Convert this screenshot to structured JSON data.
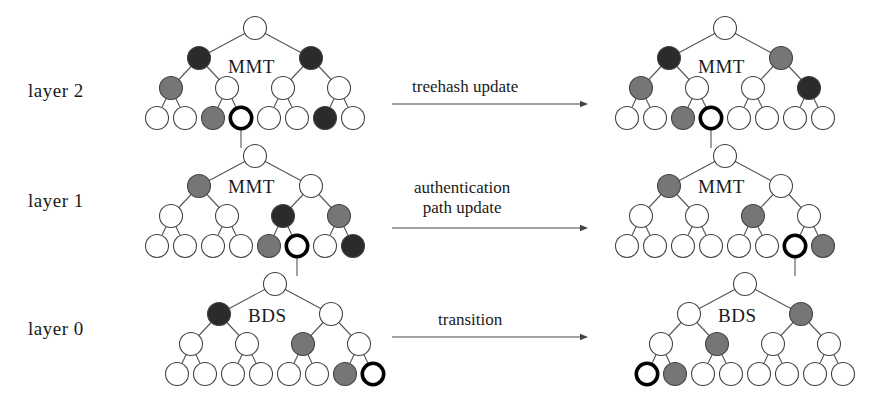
{
  "figure": {
    "background": "#ffffff",
    "width": 895,
    "height": 394
  },
  "colors": {
    "node_white": "#ffffff",
    "node_gray": "#767676",
    "node_dark": "#2b2b2b",
    "node_highlight_stroke": "#000000",
    "edge": "#555555",
    "text": "#1a1a1a"
  },
  "layer_labels": [
    {
      "text": "layer 2",
      "x": 28,
      "y": 80
    },
    {
      "text": "layer 1",
      "x": 28,
      "y": 190
    },
    {
      "text": "layer 0",
      "x": 28,
      "y": 318
    }
  ],
  "tree_names": [
    {
      "text": "MMT",
      "x": 228,
      "y": 56
    },
    {
      "text": "MMT",
      "x": 698,
      "y": 56
    },
    {
      "text": "MMT",
      "x": 228,
      "y": 176
    },
    {
      "text": "MMT",
      "x": 698,
      "y": 176
    },
    {
      "text": "BDS",
      "x": 248,
      "y": 305
    },
    {
      "text": "BDS",
      "x": 718,
      "y": 305
    }
  ],
  "arrows": [
    {
      "name": "treehash-update",
      "lines": [
        "treehash update"
      ],
      "label_x": 412,
      "label_y": 77,
      "x1": 392,
      "x2": 588,
      "y": 104
    },
    {
      "name": "authentication-path-update",
      "lines": [
        "authentication",
        "path update"
      ],
      "label_x": 414,
      "label_y": 178,
      "x1": 392,
      "x2": 588,
      "y": 228
    },
    {
      "name": "transition",
      "lines": [
        "transition"
      ],
      "label_x": 438,
      "label_y": 310,
      "x1": 392,
      "x2": 588,
      "y": 337
    }
  ],
  "trees": [
    {
      "name": "layer2-before",
      "label": "MMT",
      "root_x": 255,
      "root_y": 28,
      "x_step": 28,
      "y_step": 30,
      "radius": 11.5,
      "nodes": [
        {
          "level": 0,
          "index": 0,
          "fill": "white"
        },
        {
          "level": 1,
          "index": 0,
          "fill": "dark"
        },
        {
          "level": 1,
          "index": 1,
          "fill": "dark"
        },
        {
          "level": 2,
          "index": 0,
          "fill": "gray"
        },
        {
          "level": 2,
          "index": 1,
          "fill": "white"
        },
        {
          "level": 2,
          "index": 2,
          "fill": "white"
        },
        {
          "level": 2,
          "index": 3,
          "fill": "white"
        },
        {
          "level": 3,
          "index": 0,
          "fill": "white"
        },
        {
          "level": 3,
          "index": 1,
          "fill": "white"
        },
        {
          "level": 3,
          "index": 2,
          "fill": "gray"
        },
        {
          "level": 3,
          "index": 3,
          "fill": "highlight"
        },
        {
          "level": 3,
          "index": 4,
          "fill": "white"
        },
        {
          "level": 3,
          "index": 5,
          "fill": "white"
        },
        {
          "level": 3,
          "index": 6,
          "fill": "dark"
        },
        {
          "level": 3,
          "index": 7,
          "fill": "white"
        }
      ],
      "drop_from_leaf": 3
    },
    {
      "name": "layer2-after",
      "label": "MMT",
      "root_x": 725,
      "root_y": 28,
      "x_step": 28,
      "y_step": 30,
      "radius": 11.5,
      "nodes": [
        {
          "level": 0,
          "index": 0,
          "fill": "white"
        },
        {
          "level": 1,
          "index": 0,
          "fill": "dark"
        },
        {
          "level": 1,
          "index": 1,
          "fill": "gray"
        },
        {
          "level": 2,
          "index": 0,
          "fill": "gray"
        },
        {
          "level": 2,
          "index": 1,
          "fill": "white"
        },
        {
          "level": 2,
          "index": 2,
          "fill": "white"
        },
        {
          "level": 2,
          "index": 3,
          "fill": "dark"
        },
        {
          "level": 3,
          "index": 0,
          "fill": "white"
        },
        {
          "level": 3,
          "index": 1,
          "fill": "white"
        },
        {
          "level": 3,
          "index": 2,
          "fill": "gray"
        },
        {
          "level": 3,
          "index": 3,
          "fill": "highlight"
        },
        {
          "level": 3,
          "index": 4,
          "fill": "white"
        },
        {
          "level": 3,
          "index": 5,
          "fill": "white"
        },
        {
          "level": 3,
          "index": 6,
          "fill": "white"
        },
        {
          "level": 3,
          "index": 7,
          "fill": "white"
        }
      ],
      "drop_from_leaf": 3
    },
    {
      "name": "layer1-before",
      "label": "MMT",
      "root_x": 255,
      "root_y": 156,
      "x_step": 28,
      "y_step": 30,
      "radius": 11.5,
      "nodes": [
        {
          "level": 0,
          "index": 0,
          "fill": "white"
        },
        {
          "level": 1,
          "index": 0,
          "fill": "gray"
        },
        {
          "level": 1,
          "index": 1,
          "fill": "white"
        },
        {
          "level": 2,
          "index": 0,
          "fill": "white"
        },
        {
          "level": 2,
          "index": 1,
          "fill": "white"
        },
        {
          "level": 2,
          "index": 2,
          "fill": "dark"
        },
        {
          "level": 2,
          "index": 3,
          "fill": "gray"
        },
        {
          "level": 3,
          "index": 0,
          "fill": "white"
        },
        {
          "level": 3,
          "index": 1,
          "fill": "white"
        },
        {
          "level": 3,
          "index": 2,
          "fill": "white"
        },
        {
          "level": 3,
          "index": 3,
          "fill": "white"
        },
        {
          "level": 3,
          "index": 4,
          "fill": "gray"
        },
        {
          "level": 3,
          "index": 5,
          "fill": "highlight"
        },
        {
          "level": 3,
          "index": 6,
          "fill": "white"
        },
        {
          "level": 3,
          "index": 7,
          "fill": "dark"
        }
      ],
      "drop_from_leaf": 5
    },
    {
      "name": "layer1-after",
      "label": "MMT",
      "root_x": 725,
      "root_y": 156,
      "x_step": 28,
      "y_step": 30,
      "radius": 11.5,
      "nodes": [
        {
          "level": 0,
          "index": 0,
          "fill": "white"
        },
        {
          "level": 1,
          "index": 0,
          "fill": "gray"
        },
        {
          "level": 1,
          "index": 1,
          "fill": "white"
        },
        {
          "level": 2,
          "index": 0,
          "fill": "white"
        },
        {
          "level": 2,
          "index": 1,
          "fill": "white"
        },
        {
          "level": 2,
          "index": 2,
          "fill": "gray"
        },
        {
          "level": 2,
          "index": 3,
          "fill": "white"
        },
        {
          "level": 3,
          "index": 0,
          "fill": "white"
        },
        {
          "level": 3,
          "index": 1,
          "fill": "white"
        },
        {
          "level": 3,
          "index": 2,
          "fill": "white"
        },
        {
          "level": 3,
          "index": 3,
          "fill": "white"
        },
        {
          "level": 3,
          "index": 4,
          "fill": "white"
        },
        {
          "level": 3,
          "index": 5,
          "fill": "white"
        },
        {
          "level": 3,
          "index": 6,
          "fill": "highlight"
        },
        {
          "level": 3,
          "index": 7,
          "fill": "gray"
        }
      ],
      "drop_from_leaf": 6
    },
    {
      "name": "layer0-before",
      "label": "BDS",
      "root_x": 275,
      "root_y": 284,
      "x_step": 28,
      "y_step": 30,
      "radius": 11.5,
      "nodes": [
        {
          "level": 0,
          "index": 0,
          "fill": "white"
        },
        {
          "level": 1,
          "index": 0,
          "fill": "dark"
        },
        {
          "level": 1,
          "index": 1,
          "fill": "white"
        },
        {
          "level": 2,
          "index": 0,
          "fill": "white"
        },
        {
          "level": 2,
          "index": 1,
          "fill": "white"
        },
        {
          "level": 2,
          "index": 2,
          "fill": "gray"
        },
        {
          "level": 2,
          "index": 3,
          "fill": "white"
        },
        {
          "level": 3,
          "index": 0,
          "fill": "white"
        },
        {
          "level": 3,
          "index": 1,
          "fill": "white"
        },
        {
          "level": 3,
          "index": 2,
          "fill": "white"
        },
        {
          "level": 3,
          "index": 3,
          "fill": "white"
        },
        {
          "level": 3,
          "index": 4,
          "fill": "white"
        },
        {
          "level": 3,
          "index": 5,
          "fill": "white"
        },
        {
          "level": 3,
          "index": 6,
          "fill": "gray"
        },
        {
          "level": 3,
          "index": 7,
          "fill": "highlight"
        }
      ],
      "drop_from_leaf": null
    },
    {
      "name": "layer0-after",
      "label": "BDS",
      "root_x": 745,
      "root_y": 284,
      "x_step": 28,
      "y_step": 30,
      "radius": 11.5,
      "nodes": [
        {
          "level": 0,
          "index": 0,
          "fill": "white"
        },
        {
          "level": 1,
          "index": 0,
          "fill": "white"
        },
        {
          "level": 1,
          "index": 1,
          "fill": "gray"
        },
        {
          "level": 2,
          "index": 0,
          "fill": "white"
        },
        {
          "level": 2,
          "index": 1,
          "fill": "gray"
        },
        {
          "level": 2,
          "index": 2,
          "fill": "white"
        },
        {
          "level": 2,
          "index": 3,
          "fill": "white"
        },
        {
          "level": 3,
          "index": 0,
          "fill": "highlight"
        },
        {
          "level": 3,
          "index": 1,
          "fill": "gray"
        },
        {
          "level": 3,
          "index": 2,
          "fill": "white"
        },
        {
          "level": 3,
          "index": 3,
          "fill": "white"
        },
        {
          "level": 3,
          "index": 4,
          "fill": "white"
        },
        {
          "level": 3,
          "index": 5,
          "fill": "white"
        },
        {
          "level": 3,
          "index": 6,
          "fill": "white"
        },
        {
          "level": 3,
          "index": 7,
          "fill": "white"
        }
      ],
      "drop_from_leaf": null
    }
  ]
}
